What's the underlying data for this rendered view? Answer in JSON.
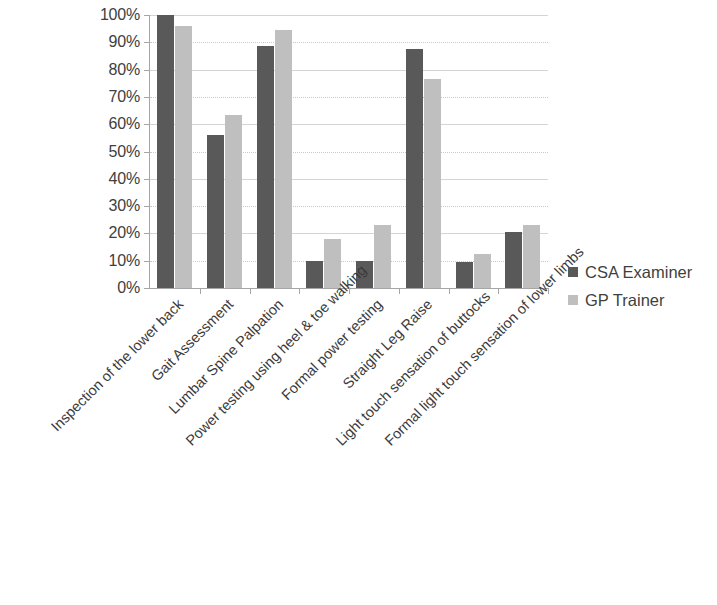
{
  "chart_data": {
    "type": "bar",
    "title": "",
    "xlabel": "",
    "ylabel": "",
    "ylim": [
      0,
      100
    ],
    "grid": true,
    "legend_position": "right",
    "categories": [
      "Inspection of the lower back",
      "Gait Assessment",
      "Lumbar Spine Palpation",
      "Power testing using heel & toe walking",
      "Formal power testing",
      "Straight Leg Raise",
      "Light touch sensation of buttocks",
      "Formal light touch sensation of lower limbs"
    ],
    "series": [
      {
        "name": "CSA Examiner",
        "color": "#595959",
        "values": [
          100,
          56,
          88.5,
          10,
          10,
          87.5,
          9.5,
          20.5
        ]
      },
      {
        "name": "GP Trainer",
        "color": "#bfbfbf",
        "values": [
          96,
          63.5,
          94.5,
          18,
          23,
          76.5,
          12.5,
          23
        ]
      }
    ],
    "y_ticks": [
      "0%",
      "10%",
      "20%",
      "30%",
      "40%",
      "50%",
      "60%",
      "70%",
      "80%",
      "90%",
      "100%"
    ],
    "y_tick_values": [
      0,
      10,
      20,
      30,
      40,
      50,
      60,
      70,
      80,
      90,
      100
    ]
  },
  "legend": {
    "items": [
      {
        "label": "CSA Examiner",
        "color": "#595959"
      },
      {
        "label": "GP Trainer",
        "color": "#bfbfbf"
      }
    ]
  },
  "colors": {
    "csa_examiner": "#595959",
    "gp_trainer": "#bfbfbf",
    "gridline": "#d4d4d4",
    "axis": "#a6a6a6",
    "text": "#3f3f3f"
  }
}
